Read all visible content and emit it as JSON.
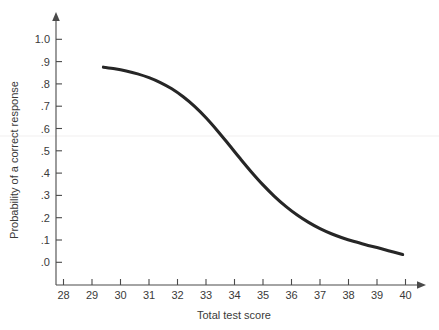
{
  "chart_data": {
    "type": "line",
    "title": "",
    "subtitle": "",
    "xlabel": "Total test score",
    "ylabel": "Probability of a correct response",
    "xlim": [
      28,
      40
    ],
    "ylim": [
      0.0,
      1.0
    ],
    "grid": false,
    "legend": null,
    "x_ticks": [
      "28",
      "29",
      "30",
      "31",
      "32",
      "33",
      "34",
      "35",
      "36",
      "37",
      "38",
      "39",
      "40"
    ],
    "x_tick_values": [
      28,
      29,
      30,
      31,
      32,
      33,
      34,
      35,
      36,
      37,
      38,
      39,
      40
    ],
    "y_ticks": [
      "1.0",
      ".9",
      ".8",
      ".7",
      ".6",
      ".5",
      ".4",
      ".3",
      ".2",
      ".1",
      ".0"
    ],
    "y_tick_values": [
      1.0,
      0.9,
      0.8,
      0.7,
      0.6,
      0.5,
      0.4,
      0.3,
      0.2,
      0.1,
      0.0
    ],
    "series": [
      {
        "name": "Item characteristic curve",
        "color": "#262626",
        "x": [
          29.4,
          29.8,
          30.2,
          30.6,
          31.0,
          31.4,
          31.8,
          32.2,
          32.6,
          33.0,
          33.4,
          33.8,
          34.2,
          34.6,
          35.0,
          35.4,
          35.8,
          36.2,
          36.6,
          37.0,
          37.4,
          37.8,
          38.2,
          38.6,
          39.0,
          39.4,
          39.9
        ],
        "values": [
          0.875,
          0.868,
          0.858,
          0.845,
          0.828,
          0.806,
          0.778,
          0.742,
          0.699,
          0.648,
          0.59,
          0.528,
          0.465,
          0.404,
          0.347,
          0.296,
          0.251,
          0.212,
          0.179,
          0.151,
          0.128,
          0.109,
          0.093,
          0.079,
          0.066,
          0.052,
          0.035
        ]
      }
    ],
    "annotations": []
  },
  "axes": {
    "x_axis_name": "Total test score",
    "y_axis_name": "Probability of a correct response",
    "x_arrow": true,
    "y_arrow": true
  }
}
